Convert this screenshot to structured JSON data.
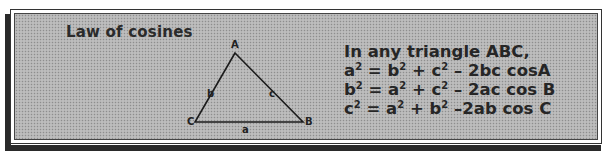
{
  "title": "Law of cosines",
  "triangle": {
    "vertices": {
      "A": {
        "label": "A",
        "x": 234,
        "y": 52
      },
      "B": {
        "label": "B",
        "x": 302,
        "y": 121
      },
      "C": {
        "label": "C",
        "x": 194,
        "y": 121
      }
    },
    "sides": {
      "a": {
        "label": "a"
      },
      "b": {
        "label": "b"
      },
      "c": {
        "label": "c"
      }
    }
  },
  "formulas": {
    "intro": "In any triangle ABC,",
    "lines": [
      {
        "lhs": "a",
        "rhs_1": "b",
        "rhs_2": "c",
        "tail": " – 2bc cosA"
      },
      {
        "lhs": "b",
        "rhs_1": "a",
        "rhs_2": "c",
        "tail": " – 2ac cos B"
      },
      {
        "lhs": "c",
        "rhs_1": "a",
        "rhs_2": "b",
        "tail": " –2ab cos C"
      }
    ],
    "exponent": "2",
    "equals": " = ",
    "plus": " + "
  },
  "colors": {
    "frame": "#333333",
    "shadow": "#2a2a2a",
    "panel_fill": "#b4b4b4",
    "text": "#262626"
  }
}
